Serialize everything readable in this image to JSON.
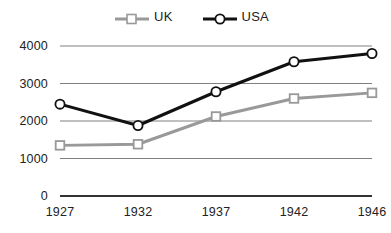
{
  "chart_data": {
    "type": "line",
    "title": "",
    "subtitle": "",
    "xlabel": "",
    "ylabel": "",
    "categories": [
      "1927",
      "1932",
      "1937",
      "1942",
      "1946"
    ],
    "x": [
      1927,
      1932,
      1937,
      1942,
      1946
    ],
    "xlim": [
      1927,
      1946
    ],
    "ylim": [
      0,
      4000
    ],
    "yticks": [
      "0",
      "1000",
      "2000",
      "3000",
      "4000"
    ],
    "ytick_values": [
      0,
      1000,
      2000,
      3000,
      4000
    ],
    "grid": true,
    "grid_axis": "y",
    "legend_position": "top-center",
    "series": [
      {
        "name": "UK",
        "values": [
          1350,
          1380,
          2120,
          2600,
          2750
        ],
        "color": "#999999",
        "marker": "square-open",
        "line_width": 3
      },
      {
        "name": "USA",
        "values": [
          2450,
          1880,
          2780,
          3580,
          3800
        ],
        "color": "#111111",
        "marker": "circle-open",
        "line_width": 3
      }
    ],
    "annotations": []
  },
  "legend": {
    "items": [
      {
        "label": "UK",
        "color": "#999999",
        "marker": "square-open"
      },
      {
        "label": "USA",
        "color": "#111111",
        "marker": "circle-open"
      }
    ]
  },
  "colors": {
    "uk": "#999999",
    "usa": "#111111",
    "gridline": "#808080",
    "axis": "#333333",
    "background": "#ffffff",
    "text": "#222222"
  },
  "axes": {
    "y_tick_labels": [
      "4000",
      "3000",
      "2000",
      "1000",
      "0"
    ],
    "x_tick_labels": [
      "1927",
      "1932",
      "1937",
      "1942",
      "1946"
    ]
  }
}
